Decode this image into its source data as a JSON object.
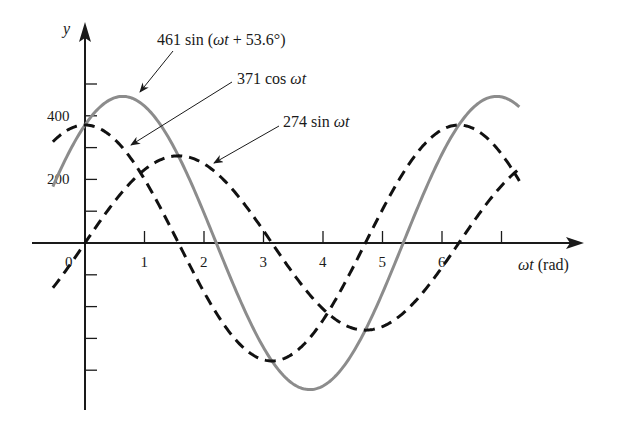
{
  "chart_data": {
    "type": "line",
    "title": "",
    "xlabel": "ωt (rad)",
    "ylabel": "y",
    "x_range": [
      -0.54,
      7.3
    ],
    "xlim": [
      -0.9,
      8.4
    ],
    "ylim": [
      -520,
      690
    ],
    "grid": false,
    "legend": "annotations with arrows",
    "x_ticks": [
      0,
      1,
      2,
      3,
      4,
      5,
      6,
      7
    ],
    "x_tick_labels": [
      "0",
      "1",
      "2",
      "3",
      "4",
      "5",
      "6",
      ""
    ],
    "y_ticks": [
      -400,
      -300,
      -200,
      -100,
      100,
      200,
      300,
      400,
      500
    ],
    "y_tick_labels": {
      "200": "200",
      "400": "400"
    },
    "series": [
      {
        "name": "461 sin (ωt + 53.6°)",
        "function": "461*sin(t + 53.6deg)",
        "amplitude": 461,
        "phase_deg": 53.6,
        "kind": "sin",
        "style": "solid",
        "color": "#8c8c8c",
        "sample_points": {
          "x": [
            0,
            0.64,
            2.2,
            3.78,
            5.35,
            6.92
          ],
          "y": [
            371,
            461,
            0,
            -461,
            0,
            461
          ]
        }
      },
      {
        "name": "371 cos ωt",
        "function": "371*cos(t)",
        "amplitude": 371,
        "phase_deg": 90,
        "kind": "sin",
        "style": "dashed",
        "color": "#111111",
        "sample_points": {
          "x": [
            0,
            1.57,
            3.14,
            4.71,
            6.28
          ],
          "y": [
            371,
            0,
            -371,
            0,
            371
          ]
        }
      },
      {
        "name": "274 sin ωt",
        "function": "274*sin(t)",
        "amplitude": 274,
        "phase_deg": 0,
        "kind": "sin",
        "style": "dashed",
        "color": "#111111",
        "sample_points": {
          "x": [
            0,
            1.57,
            3.14,
            4.71,
            6.28
          ],
          "y": [
            0,
            274,
            0,
            -274,
            0
          ]
        }
      }
    ],
    "annotations": [
      {
        "text_pre": "461 sin (",
        "text_ital": "ωt",
        "text_post": " + 53.6°)",
        "series": 0
      },
      {
        "text_pre": "371 cos ",
        "text_ital": "ωt",
        "text_post": "",
        "series": 1
      },
      {
        "text_pre": "274 sin ",
        "text_ital": "ωt",
        "text_post": "",
        "series": 2
      }
    ]
  },
  "axes": {
    "x_label_ital": "ωt",
    "x_label_unit": " (rad)",
    "y_label": "y"
  }
}
